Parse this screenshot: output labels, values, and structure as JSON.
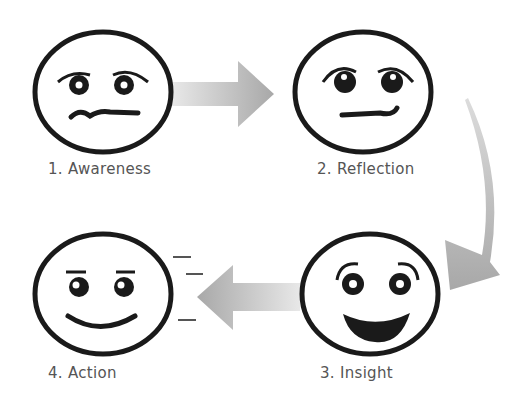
{
  "diagram": {
    "title": "",
    "steps": [
      {
        "number": 1,
        "label": "1. Awareness",
        "expression": "worried"
      },
      {
        "number": 2,
        "label": "2. Reflection",
        "expression": "thoughtful"
      },
      {
        "number": 3,
        "label": "3. Insight",
        "expression": "delighted"
      },
      {
        "number": 4,
        "label": "4. Action",
        "expression": "smiling"
      }
    ],
    "arrows": [
      {
        "from": "1. Awareness",
        "to": "2. Reflection",
        "shape": "straight-right"
      },
      {
        "from": "2. Reflection",
        "to": "3. Insight",
        "shape": "curved-down"
      },
      {
        "from": "3. Insight",
        "to": "4. Action",
        "shape": "straight-left"
      }
    ],
    "colors": {
      "outline": "#1a1a1a",
      "arrow_light": "#e4e4e4",
      "arrow_dark": "#a8a8a8",
      "label": "#555555"
    }
  }
}
